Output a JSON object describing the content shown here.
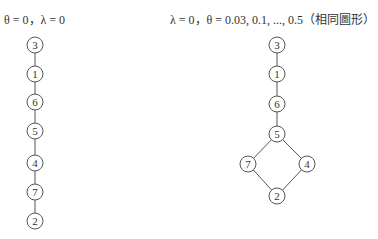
{
  "left_panel": {
    "title": "θ = 0，λ = 0",
    "nodes": [
      {
        "id": "3",
        "x": 35,
        "y": 45
      },
      {
        "id": "1",
        "x": 35,
        "y": 74
      },
      {
        "id": "6",
        "x": 35,
        "y": 102
      },
      {
        "id": "5",
        "x": 35,
        "y": 131
      },
      {
        "id": "4",
        "x": 35,
        "y": 163
      },
      {
        "id": "7",
        "x": 35,
        "y": 192
      },
      {
        "id": "2",
        "x": 35,
        "y": 221
      }
    ],
    "edges": [
      [
        "3",
        "1"
      ],
      [
        "1",
        "6"
      ],
      [
        "6",
        "5"
      ],
      [
        "5",
        "4"
      ],
      [
        "4",
        "7"
      ],
      [
        "7",
        "2"
      ]
    ]
  },
  "right_panel": {
    "title": "λ = 0，θ = 0.03, 0.1, ..., 0.5（相同圖形）",
    "nodes": [
      {
        "id": "3",
        "x": 277,
        "y": 45
      },
      {
        "id": "1",
        "x": 277,
        "y": 74
      },
      {
        "id": "6",
        "x": 277,
        "y": 104
      },
      {
        "id": "5",
        "x": 277,
        "y": 134
      },
      {
        "id": "7",
        "x": 248,
        "y": 164
      },
      {
        "id": "4",
        "x": 307,
        "y": 164
      },
      {
        "id": "2",
        "x": 277,
        "y": 196
      }
    ],
    "edges": [
      [
        "3",
        "1"
      ],
      [
        "1",
        "6"
      ],
      [
        "6",
        "5"
      ],
      [
        "5",
        "7"
      ],
      [
        "5",
        "4"
      ],
      [
        "7",
        "2"
      ],
      [
        "4",
        "2"
      ]
    ]
  },
  "style": {
    "stroke": "#555555",
    "node_fill": "#ffffff",
    "node_radius": 8
  }
}
